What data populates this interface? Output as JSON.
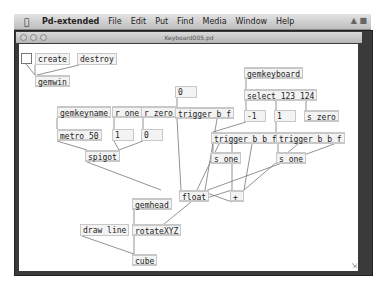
{
  "menubar": {
    "apple_icon": "",
    "items": [
      "Pd-extended",
      "File",
      "Edit",
      "Put",
      "Find",
      "Media",
      "Window",
      "Help"
    ]
  },
  "window": {
    "title": "Keyboard005.pd"
  },
  "objects": {
    "toggle": "",
    "create": "create",
    "destroy": "destroy",
    "gemwin": "gemwin",
    "gemkeyname": "gemkeyname",
    "r_one": "r one",
    "r_zero": "r zero",
    "metro": "metro 50",
    "num1": "1",
    "num0": "0",
    "spigot": "spigot",
    "num_top0": "0",
    "trigger_bf": "trigger b f",
    "gemkeyboard": "gemkeyboard",
    "select": "select 123 124",
    "neg1": "-1",
    "pos1": "1",
    "s_zero": "s zero",
    "trigger_bbf_1": "trigger b b f",
    "trigger_bbf_2": "trigger b b f",
    "s_one_1": "s one",
    "s_one_2": "s one",
    "float": "float",
    "plus": "+",
    "gemhead": "gemhead",
    "draw_line": "draw line",
    "rotateXYZ": "rotateXYZ",
    "cube": "cube"
  }
}
